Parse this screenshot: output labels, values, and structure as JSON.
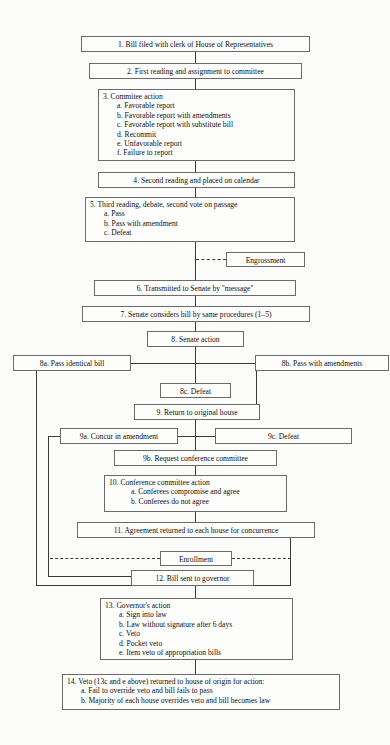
{
  "diagram": {
    "type": "flowchart",
    "background_color": "#fbfbfa",
    "box_border_color": "#6a6a6a",
    "line_color": "#3a3a3a"
  },
  "nodes": {
    "n1": {
      "label": "1.  Bill filed with clerk of House of Representatives"
    },
    "n2": {
      "label": "2.  First reading and assignment to committee"
    },
    "n3": {
      "title": "3.  Commitee action",
      "items": [
        "a. Favorable report",
        "b. Favorable report with amendments",
        "c. Favorable report with substitute bill",
        "d. Recommit",
        "e. Unfavorable report",
        "f. Failure to report"
      ]
    },
    "n4": {
      "label": "4.  Second reading and placed on calendar"
    },
    "n5": {
      "title": "5.  Third reading, debate, second vote on passage",
      "items": [
        "a. Pass",
        "b. Pass with amendment",
        "c. Defeat"
      ]
    },
    "engrossment": {
      "label": "Engrossment"
    },
    "n6": {
      "label": "6.  Transmitted to Senate by ''message''"
    },
    "n7": {
      "label": "7.  Senate considers bill by same procedures (1–5)"
    },
    "n8": {
      "label": "8.  Senate action"
    },
    "n8a": {
      "label": "8a.  Pass identical bill"
    },
    "n8b": {
      "label": "8b.  Pass with amendments"
    },
    "n8c": {
      "label": "8c.  Defeat"
    },
    "n9": {
      "label": "9.  Return to original house"
    },
    "n9a": {
      "label": "9a.  Concur in amendment"
    },
    "n9c": {
      "label": "9c.  Defeat"
    },
    "n9b": {
      "label": "9b.  Request conference committee"
    },
    "n10": {
      "title": "10. Conference committee action",
      "items": [
        "a. Conferees compromise and agree",
        "b. Conferees do not agree"
      ]
    },
    "n11": {
      "label": "11.  Agreement returned to each house for concurrence"
    },
    "enrollment": {
      "label": "Enrollment"
    },
    "n12": {
      "label": "12.  Bill sent to governor"
    },
    "n13": {
      "title": "13.  Governor's action",
      "items": [
        "a. Sign into law",
        "b. Law without signature after 6 days",
        "c. Veto",
        "d. Pocket veto",
        "e. Item veto of appropriation bills"
      ]
    },
    "n14": {
      "title": "14.  Veto (13c and e above) returned to house of origin for action:",
      "items": [
        "a. Fail to override veto and bill fails to pass",
        "b. Majority of each house overrides veto and bill becomes law"
      ]
    }
  }
}
